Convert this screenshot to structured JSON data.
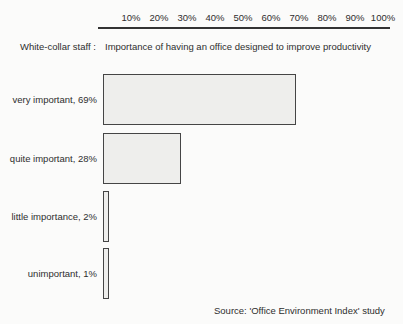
{
  "chart_data": {
    "type": "bar",
    "orientation": "horizontal",
    "group_label": "White-collar staff :",
    "title": "Importance of having an office designed to improve productivity",
    "categories": [
      "very important, 69%",
      "quite important, 28%",
      "little importance, 2%",
      "unimportant, 1%"
    ],
    "values": [
      69,
      28,
      2,
      1
    ],
    "x_ticks": [
      "10%",
      "20%",
      "30%",
      "40%",
      "50%",
      "60%",
      "70%",
      "80%",
      "90%",
      "100%"
    ],
    "xlim": [
      0,
      100
    ],
    "xlabel": "",
    "ylabel": "",
    "grid": false,
    "legend": "none",
    "source": "Source: 'Office Environment Index' study"
  },
  "colors": {
    "background": "#fbfbfa",
    "text": "#2e2e2e",
    "bar_fill": "#eeeeec",
    "bar_border": "#454545",
    "axis_line": "#333333"
  }
}
